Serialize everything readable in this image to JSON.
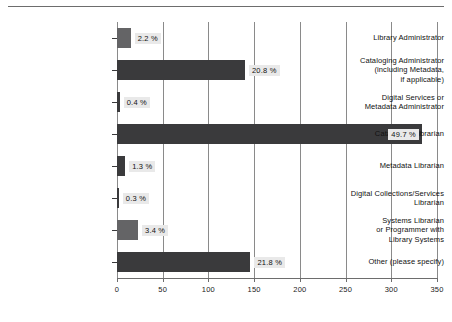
{
  "chart_data": {
    "type": "bar",
    "orientation": "horizontal",
    "title": "",
    "xlabel": "",
    "ylabel": "",
    "xlim": [
      0,
      350
    ],
    "xticks": [
      0,
      50,
      100,
      150,
      200,
      250,
      300,
      350
    ],
    "xtick_labels": [
      "0",
      "50",
      "100",
      "150",
      "200",
      "250",
      "300",
      "350"
    ],
    "grid": true,
    "legend": "none",
    "categories": [
      "Library Administrator",
      "Cataloging Administrator\n(including Metadata,\nif applicable)",
      "Digital Services or\nMetadata Administrator",
      "Cataloging Librarian",
      "Metadata Librarian",
      "Digital Collections/Services\nLibrarian",
      "Systems Librarian\nor Programmer with\nLibrary Systems",
      "Other (please specify)"
    ],
    "values": [
      15,
      140,
      3,
      334,
      9,
      2,
      23,
      146
    ],
    "data_labels": [
      "2.2 %",
      "20.8 %",
      "0.4 %",
      "49.7 %",
      "1.3 %",
      "0.3 %",
      "3.4 %",
      "21.8 %"
    ],
    "percentages": [
      2.2,
      20.8,
      0.4,
      49.7,
      1.3,
      0.3,
      3.4,
      21.8
    ],
    "bar_colors": [
      "#646466",
      "#3a3a3c",
      "#3a3a3c",
      "#3a3a3c",
      "#3a3a3c",
      "#3a3a3c",
      "#646466",
      "#3a3a3c"
    ]
  },
  "colors": {
    "bar_dark": "#3a3a3c",
    "bar_mid": "#646466",
    "gridline": "#8a8a8a",
    "axis": "#6d6d6d",
    "label_background": "#e9e9e9",
    "text": "#111111",
    "background": "#ffffff"
  }
}
